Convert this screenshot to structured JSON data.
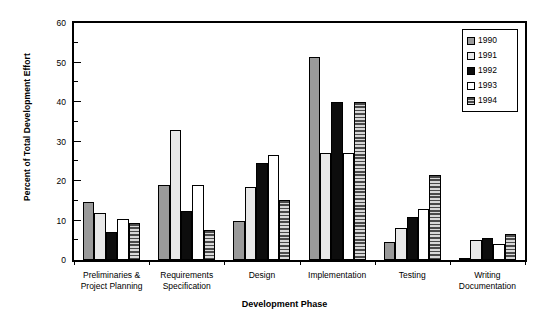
{
  "chart_data": {
    "type": "bar",
    "title": "",
    "xlabel": "Development Phase",
    "ylabel": "Percent of Total Development Effort",
    "ylim": [
      0,
      60
    ],
    "yticks": [
      0,
      10,
      20,
      30,
      40,
      50,
      60
    ],
    "yminorticks": [
      5,
      15,
      25,
      35,
      45,
      55
    ],
    "grid": false,
    "legend_position": "top-right",
    "categories": [
      "Preliminaries &\nProject Planning",
      "Requirements\nSpecification",
      "Design",
      "Implementation",
      "Testing",
      "Writing\nDocumentation"
    ],
    "series": [
      {
        "name": "1990",
        "fill": "solid-gray",
        "color": "#9a9a9a",
        "values": [
          14.8,
          19.0,
          10.0,
          51.5,
          4.5,
          0.3
        ]
      },
      {
        "name": "1991",
        "fill": "light-gray",
        "color": "#e8e8e8",
        "values": [
          11.8,
          33.0,
          18.5,
          27.0,
          8.0,
          5.0
        ]
      },
      {
        "name": "1992",
        "fill": "solid-black",
        "color": "#0d0d0d",
        "values": [
          7.2,
          12.3,
          24.5,
          40.0,
          11.0,
          5.5
        ]
      },
      {
        "name": "1993",
        "fill": "white",
        "color": "#ffffff",
        "values": [
          10.3,
          19.0,
          26.5,
          27.0,
          13.0,
          4.0
        ]
      },
      {
        "name": "1994",
        "fill": "hatch-horizontal",
        "color": "#8a8a8a",
        "values": [
          9.3,
          7.7,
          15.3,
          40.0,
          21.5,
          6.5
        ]
      }
    ]
  },
  "legend": {
    "entries": [
      {
        "label": "1990"
      },
      {
        "label": "1991"
      },
      {
        "label": "1992"
      },
      {
        "label": "1993"
      },
      {
        "label": "1994"
      }
    ]
  }
}
